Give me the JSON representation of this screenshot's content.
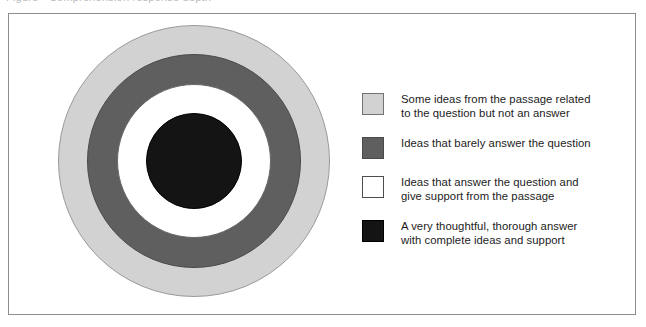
{
  "page": {
    "top_cut_caption": "Figure   •   Comprehension response depth",
    "background_color": "#ffffff"
  },
  "frame": {
    "border_color": "#8d8d8d"
  },
  "diagram": {
    "name": "concentric-target-diagram",
    "type": "concentric-circles",
    "center": {
      "x": 193,
      "y": 160
    },
    "rings": [
      {
        "id": "outer",
        "label": "Some ideas from the passage related to the question but not an answer",
        "color": "#d2d2d2",
        "border_color": "#9a9a9a",
        "outer_radius": 136
      },
      {
        "id": "second",
        "label": "Ideas that barely answer the question",
        "color": "#5f5f5f",
        "border_color": "#4a4a4a",
        "outer_radius": 107
      },
      {
        "id": "third",
        "label": "Ideas that answer the question and give support from the passage",
        "color": "#ffffff",
        "border_color": "#6a6a6a",
        "outer_radius": 77
      },
      {
        "id": "core",
        "label": "A very thoughtful, thorough answer with complete ideas and support",
        "color": "#141414",
        "border_color": "#000000",
        "outer_radius": 48
      }
    ]
  },
  "legend": {
    "items": [
      {
        "swatch_color": "#d2d2d2",
        "swatch_border": "#737373",
        "text": "Some ideas from the passage related\nto the question but not an answer"
      },
      {
        "swatch_color": "#5f5f5f",
        "swatch_border": "#4a4a4a",
        "text": "Ideas that barely answer the question"
      },
      {
        "swatch_color": "#ffffff",
        "swatch_border": "#4d4d4d",
        "text": "Ideas that answer the question and\ngive support from the passage"
      },
      {
        "swatch_color": "#141414",
        "swatch_border": "#000000",
        "text": "A very thoughtful, thorough answer\nwith complete ideas and support"
      }
    ]
  }
}
